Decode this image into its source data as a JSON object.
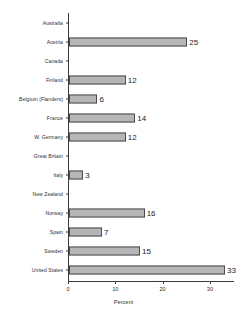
{
  "chart_data": {
    "type": "bar",
    "orientation": "horizontal",
    "title": "",
    "xlabel": "Percent",
    "ylabel": "",
    "xlim": [
      0,
      33.5
    ],
    "xticks": [
      0,
      10,
      20,
      30
    ],
    "xtick_labels": [
      "0",
      "10",
      "20",
      "30"
    ],
    "grid": false,
    "legend": null,
    "categories": [
      "Australia",
      "Austria",
      "Canada",
      "Finland",
      "Belgium (Flanders)",
      "France",
      "W. Germany",
      "Great Britain",
      "Italy",
      "New Zealand",
      "Norway",
      "Spain",
      "Sweden",
      "United States"
    ],
    "values": [
      0,
      25,
      0,
      12,
      6,
      14,
      12,
      0,
      3,
      0,
      16,
      7,
      15,
      33
    ],
    "value_labels": [
      "",
      "25",
      "",
      "12",
      "6",
      "14",
      "12",
      "",
      "3",
      "",
      "16",
      "7",
      "15",
      "33"
    ],
    "bar_fill_color": "#b6b6b6",
    "bar_border_color": "#4a4a4a",
    "axis_color": "#3a3a3a",
    "text_color": "#2f2f2f",
    "background_color": "#ffffff"
  }
}
